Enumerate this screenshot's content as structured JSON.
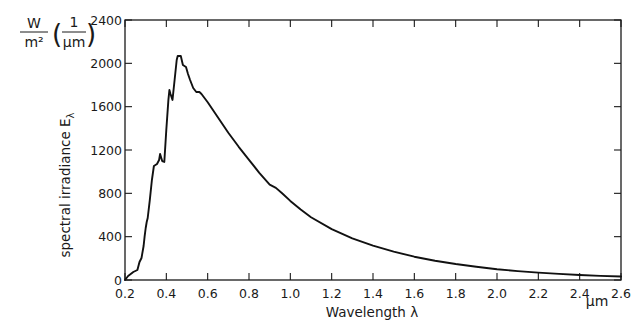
{
  "chart_data": {
    "type": "line",
    "title": "",
    "xlabel": "Wavelength λ",
    "x_unit": "µm",
    "ylabel": "spectral irradiance E",
    "ylabel_subscript": "λ",
    "y_unit": {
      "numerator": "W",
      "denominator": "m²",
      "factor_numerator": "1",
      "factor_denominator": "µm"
    },
    "xlim": [
      0.2,
      2.6
    ],
    "ylim": [
      0,
      2400
    ],
    "xticks": [
      "0.2",
      "0.4",
      "0.6",
      "0.8",
      "1.0",
      "1.2",
      "1.4",
      "1.6",
      "1.8",
      "2.0",
      "2.2",
      "2.4",
      "2.6"
    ],
    "yticks": [
      "0",
      "400",
      "800",
      "1200",
      "1600",
      "2000",
      "2400"
    ],
    "grid": false,
    "legend": null,
    "frame": "box with inward ticks on all four sides",
    "series": [
      {
        "name": "Solar spectral irradiance",
        "color": "#111111",
        "x": [
          0.2,
          0.215,
          0.24,
          0.26,
          0.27,
          0.28,
          0.29,
          0.295,
          0.3,
          0.305,
          0.31,
          0.32,
          0.33,
          0.34,
          0.355,
          0.365,
          0.37,
          0.38,
          0.39,
          0.4,
          0.41,
          0.415,
          0.42,
          0.43,
          0.44,
          0.45,
          0.455,
          0.47,
          0.48,
          0.495,
          0.505,
          0.515,
          0.53,
          0.545,
          0.56,
          0.57,
          0.6,
          0.65,
          0.7,
          0.75,
          0.8,
          0.85,
          0.9,
          0.93,
          0.96,
          1.0,
          1.05,
          1.1,
          1.2,
          1.3,
          1.4,
          1.5,
          1.6,
          1.7,
          1.8,
          1.9,
          2.0,
          2.1,
          2.2,
          2.3,
          2.4,
          2.5,
          2.6
        ],
        "values": [
          0,
          37,
          74,
          92,
          166,
          203,
          314,
          400,
          480,
          535,
          572,
          738,
          923,
          1052,
          1071,
          1108,
          1163,
          1098,
          1089,
          1385,
          1662,
          1754,
          1717,
          1662,
          1846,
          2031,
          2068,
          2068,
          1985,
          1966,
          1902,
          1846,
          1772,
          1735,
          1735,
          1717,
          1640,
          1500,
          1360,
          1230,
          1110,
          990,
          880,
          850,
          800,
          730,
          650,
          580,
          470,
          385,
          318,
          262,
          215,
          178,
          148,
          122,
          100,
          82,
          68,
          56,
          46,
          38,
          32
        ]
      }
    ]
  }
}
